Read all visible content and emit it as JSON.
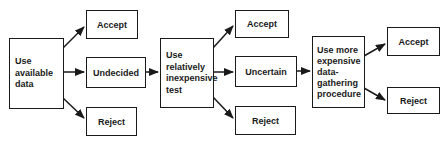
{
  "diagram": {
    "stages": [
      {
        "label_lines": [
          "Use",
          "available",
          "data"
        ],
        "outcomes": [
          "Accept",
          "Undecided",
          "Reject"
        ]
      },
      {
        "label_lines": [
          "Use",
          "relatively",
          "inexpensive",
          "test"
        ],
        "outcomes": [
          "Accept",
          "Uncertain",
          "Reject"
        ]
      },
      {
        "label_lines": [
          "Use more",
          "expensive",
          "data-",
          "gathering",
          "procedure"
        ],
        "outcomes": [
          "Accept",
          "Reject"
        ]
      }
    ],
    "colors": {
      "line": "#1a1a1a",
      "background": "#ffffff"
    }
  }
}
